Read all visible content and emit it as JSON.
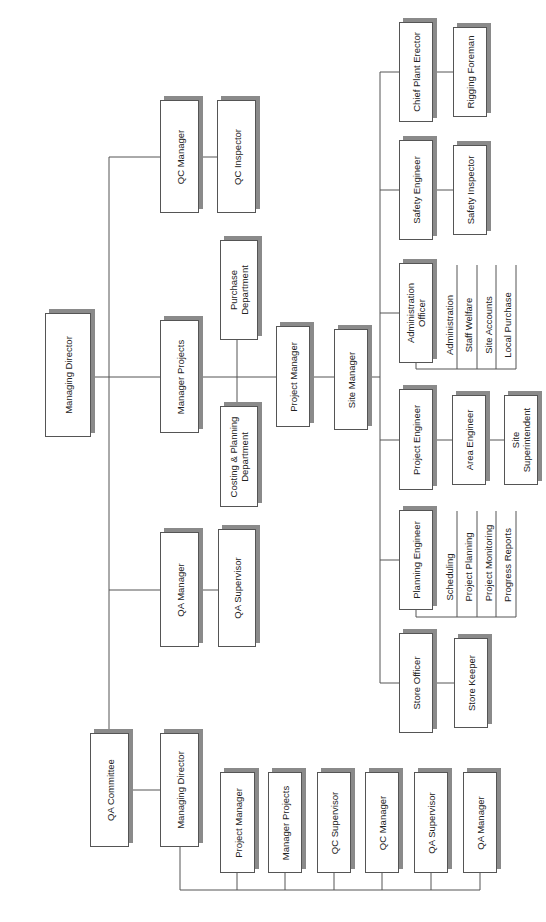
{
  "diagram": {
    "type": "organization-chart",
    "orientation": "rotated-90-ccw",
    "line_color": "#555555",
    "shadow_color": "#8a8a8a",
    "nodes": {
      "managing_director_top": "Managing Director",
      "qc_manager": "QC Manager",
      "qc_inspector": "QC Inspector",
      "manager_projects": "Manager Projects",
      "purchase_department": "Purchase\nDepartment",
      "costing_planning_department": "Costing & Planning\nDepartment",
      "qa_manager": "QA Manager",
      "qa_supervisor": "QA Supervisor",
      "qa_committee": "QA Committee",
      "managing_director_committee": "Managing Director",
      "project_manager": "Project Manager",
      "site_manager": "Site Manager",
      "chief_plant_erector": "Chief Plant Erector",
      "rigging_foreman": "Rigging Foreman",
      "safety_engineer": "Safety Engineer",
      "safety_inspector": "Safety Inspector",
      "administration_officer": "Administration\nOfficer",
      "project_engineer": "Project Engineer",
      "area_engineer": "Area Engineer",
      "site_superintendent": "Site\nSuperintendent",
      "planning_engineer": "Planning Engineer",
      "store_officer": "Store Officer",
      "store_keeper": "Store Keeper"
    },
    "admin_duties": [
      "Administration",
      "Staff Welfare",
      "Site Accounts",
      "Local Purchase"
    ],
    "planning_duties": [
      "Scheduling",
      "Project Planning",
      "Project Monitoring",
      "Progress Reports"
    ],
    "committee_members": [
      "Project Manager",
      "Manager Projects",
      "QC Supervisor",
      "QC Manager",
      "QA Supervisor",
      "QA Manager"
    ]
  }
}
